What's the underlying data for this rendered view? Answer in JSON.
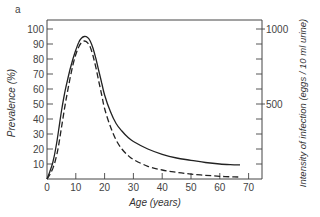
{
  "panel_label": "a",
  "chart_data": {
    "type": "line",
    "title": "",
    "xlabel": "Age (years)",
    "ylabel": "Prevalence (%)",
    "y2label": "Intensity of infection (eggs / 10 ml urine)",
    "xlim": [
      0,
      75
    ],
    "ylim": [
      0,
      100
    ],
    "y2lim": [
      0,
      1000
    ],
    "xticks": [
      0,
      10,
      20,
      30,
      40,
      50,
      60,
      70
    ],
    "yticks": [
      10,
      20,
      30,
      40,
      50,
      60,
      70,
      80,
      90,
      100
    ],
    "y2ticks_labeled": [
      500,
      1000
    ],
    "y2ticks": [
      100,
      200,
      300,
      400,
      500,
      600,
      700,
      800,
      900,
      1000
    ],
    "grid": false,
    "legend": null,
    "series": [
      {
        "name": "Prevalence (%)",
        "axis": "left",
        "style": "solid",
        "x": [
          0,
          1,
          2,
          3,
          4,
          5,
          6,
          7,
          8,
          9,
          10,
          11,
          12,
          13,
          14,
          15,
          16,
          17,
          18,
          19,
          20,
          22,
          24,
          26,
          28,
          30,
          35,
          40,
          45,
          50,
          55,
          60,
          65,
          67
        ],
        "y": [
          0,
          5,
          11,
          20,
          32,
          45,
          56,
          65,
          73,
          80,
          86,
          91,
          94,
          95,
          94.5,
          92,
          87,
          80,
          72,
          64,
          56,
          45,
          37,
          32,
          28,
          25,
          20,
          16.5,
          14,
          12.5,
          11,
          10,
          9.5,
          9.5
        ]
      },
      {
        "name": "Intensity of infection (eggs / 10 ml urine)",
        "axis": "right",
        "style": "dashed",
        "x": [
          0,
          1,
          2,
          3,
          4,
          5,
          6,
          7,
          8,
          9,
          10,
          11,
          12,
          13,
          14,
          15,
          16,
          17,
          18,
          19,
          20,
          22,
          24,
          26,
          28,
          30,
          35,
          40,
          45,
          50,
          55,
          60,
          65,
          67
        ],
        "y": [
          0,
          30,
          70,
          130,
          220,
          340,
          460,
          570,
          670,
          760,
          830,
          880,
          910,
          920,
          910,
          880,
          820,
          740,
          650,
          560,
          470,
          350,
          260,
          200,
          160,
          130,
          85,
          60,
          45,
          33,
          25,
          18,
          14,
          13
        ]
      }
    ]
  }
}
